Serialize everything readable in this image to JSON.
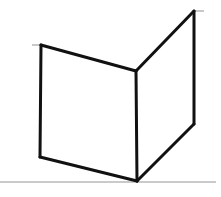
{
  "canvas": {
    "width": 221,
    "height": 197,
    "background_color": "#ffffff"
  },
  "diagram": {
    "stroke_color": "#111111",
    "stroke_width": 3,
    "ground_line_color": "#b9b9b9",
    "ground_line_width": 1.6,
    "tick_color": "#b0b0b0",
    "tick_width": 1.4,
    "vertices": {
      "left_top_outer": {
        "x": 41,
        "y": 45
      },
      "left_bottom_outer": {
        "x": 40,
        "y": 157
      },
      "center_top": {
        "x": 136,
        "y": 71
      },
      "center_bottom": {
        "x": 137,
        "y": 181
      },
      "right_top_outer": {
        "x": 194,
        "y": 11
      },
      "right_bottom_outer": {
        "x": 194,
        "y": 124
      }
    },
    "edges": [
      {
        "name": "left-panel-top-edge",
        "from": "left_top_outer",
        "to": "center_top"
      },
      {
        "name": "left-panel-outer-vertical",
        "from": "left_top_outer",
        "to": "left_bottom_outer"
      },
      {
        "name": "left-panel-bottom-edge",
        "from": "left_bottom_outer",
        "to": "center_bottom"
      },
      {
        "name": "corner-vertical-edge",
        "from": "center_top",
        "to": "center_bottom"
      },
      {
        "name": "right-panel-top-edge",
        "from": "center_top",
        "to": "right_top_outer"
      },
      {
        "name": "right-panel-outer-vertical",
        "from": "right_top_outer",
        "to": "right_bottom_outer"
      },
      {
        "name": "right-panel-bottom-edge",
        "from": "right_bottom_outer",
        "to": "center_bottom"
      }
    ],
    "ground_line": {
      "x1": 0,
      "y1": 182,
      "x2": 216,
      "y2": 182
    },
    "ticks": [
      {
        "name": "left-top-tick",
        "x1": 32,
        "y1": 45,
        "x2": 43,
        "y2": 45
      },
      {
        "name": "right-top-tick",
        "x1": 193,
        "y1": 11,
        "x2": 204,
        "y2": 11
      }
    ]
  }
}
